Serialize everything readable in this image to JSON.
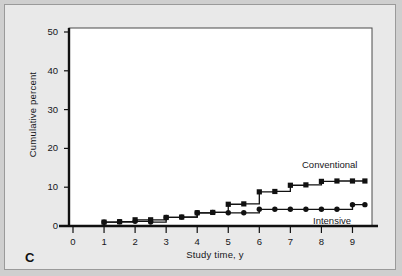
{
  "panel": {
    "letter": "C",
    "background_color": "#e9e9e9",
    "plot_background_color": "#ffffff",
    "border_color": "#9a9a9a"
  },
  "chart_data": {
    "type": "line",
    "title": "",
    "subtitle": "",
    "xlabel": "Study time, y",
    "ylabel": "Cumulative percent",
    "xlim": [
      0,
      9.5
    ],
    "ylim": [
      0,
      50
    ],
    "xticks": [
      "0",
      "1",
      "2",
      "3",
      "4",
      "5",
      "6",
      "7",
      "8",
      "9"
    ],
    "xtick_values": [
      0,
      1,
      2,
      3,
      4,
      5,
      6,
      7,
      8,
      9
    ],
    "yticks": [
      "0",
      "10",
      "20",
      "30",
      "40",
      "50"
    ],
    "ytick_values": [
      0,
      10,
      20,
      30,
      40,
      50
    ],
    "grid": false,
    "legend_position": "inline-annotation",
    "style": "step",
    "line_color": "#111111",
    "marker_shape_conventional": "square",
    "marker_shape_intensive": "circle",
    "series": [
      {
        "name": "Conventional",
        "label": "Conventional",
        "marker": "square",
        "x": [
          0,
          1,
          1.5,
          2,
          2.5,
          3,
          3.5,
          4,
          4.5,
          5,
          5.5,
          6,
          6.5,
          7,
          7.5,
          8,
          8.5,
          9,
          9.4
        ],
        "values": [
          0,
          1.0,
          1.1,
          1.6,
          1.6,
          2.2,
          2.3,
          3.4,
          3.5,
          5.6,
          5.7,
          8.8,
          8.9,
          10.5,
          10.6,
          11.5,
          11.6,
          11.6,
          11.6
        ]
      },
      {
        "name": "Intensive",
        "label": "Intensive",
        "marker": "circle",
        "x": [
          0,
          1,
          1.5,
          2,
          2.5,
          3,
          3.5,
          4,
          4.5,
          5,
          5.5,
          6,
          6.5,
          7,
          7.5,
          8,
          8.5,
          9,
          9.4
        ],
        "values": [
          0,
          1.0,
          1.1,
          1.2,
          1.0,
          2.2,
          2.3,
          3.4,
          3.5,
          3.4,
          3.4,
          4.3,
          4.3,
          4.3,
          4.3,
          4.3,
          4.3,
          5.5,
          5.5
        ]
      }
    ]
  }
}
